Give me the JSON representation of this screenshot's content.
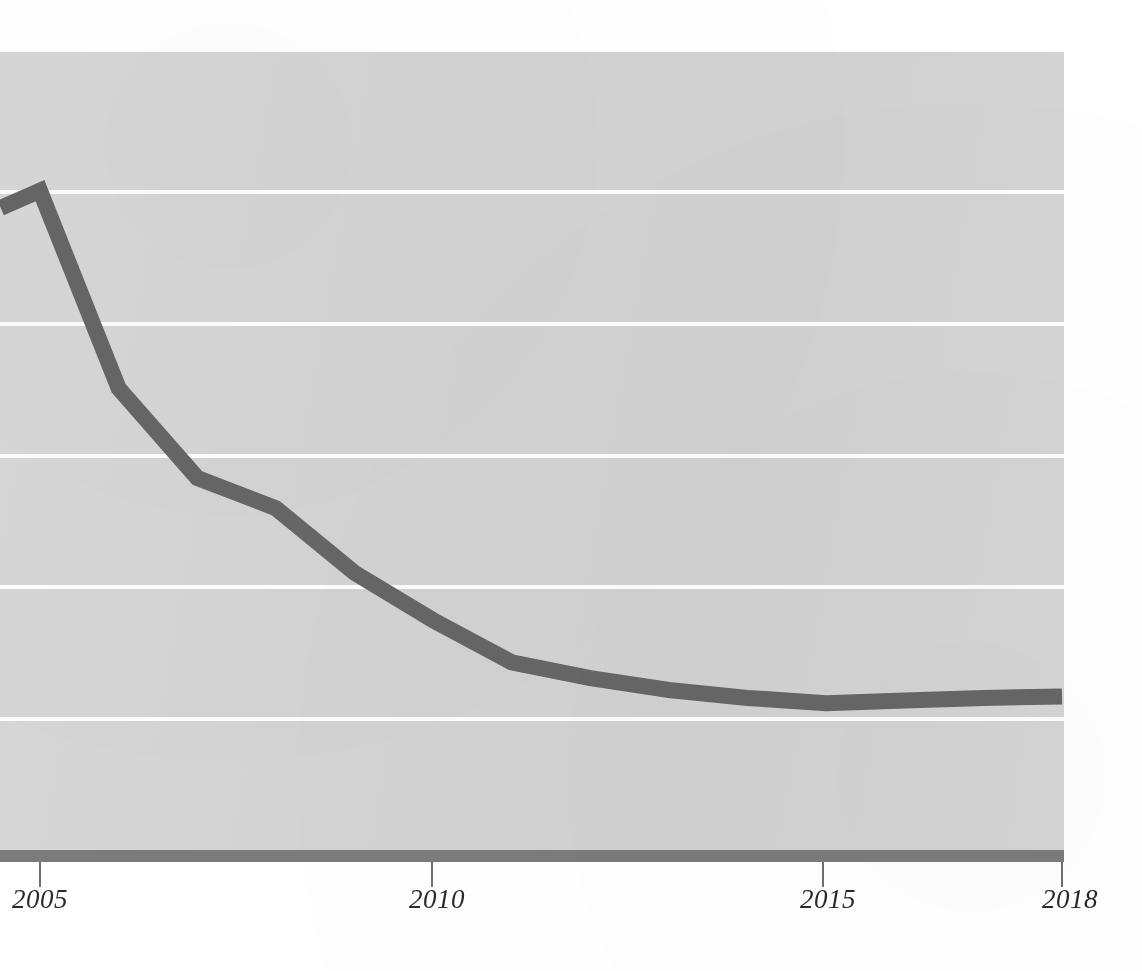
{
  "chart_data": {
    "type": "line",
    "title": "",
    "subtitle": "",
    "xlabel": "",
    "ylabel": "",
    "xlim": [
      2004.5,
      2018.0
    ],
    "ylim": [
      -1.0,
      5.0
    ],
    "grid": "horizontal",
    "gridline_values": [
      4.0,
      3.0,
      2.0,
      1.0,
      0.0
    ],
    "legend": "none",
    "x_tick_labels": [
      "2005",
      "2010",
      "2015",
      "2018"
    ],
    "x_tick_values": [
      2005,
      2010,
      2015,
      2018
    ],
    "y_tick_labels": [],
    "series": [
      {
        "name": "series-1",
        "color": "#666666",
        "line_width_px": 16,
        "x": [
          2004.5,
          2005,
          2006,
          2007,
          2008,
          2009,
          2010,
          2011,
          2012,
          2013,
          2014,
          2015,
          2016,
          2017,
          2018
        ],
        "values": [
          3.88,
          4.01,
          2.51,
          1.83,
          1.6,
          1.11,
          0.75,
          0.43,
          0.31,
          0.22,
          0.16,
          0.12,
          0.14,
          0.16,
          0.17
        ]
      }
    ],
    "annotations": []
  },
  "figure": {
    "background_color": "#ffffff",
    "panel_color": "#d3d3d3",
    "gridline_color": "#fdfdfd",
    "axis_bar_color": "#7b7b7b",
    "tick_color": "#6f6f6f",
    "tick_label_color": "#2a2a2a",
    "series_color": "#666666"
  },
  "axis": {
    "ticks": [
      {
        "label": "2005",
        "value": 2005
      },
      {
        "label": "2010",
        "value": 2010
      },
      {
        "label": "2015",
        "value": 2015
      },
      {
        "label": "2018",
        "value": 2018
      }
    ]
  }
}
